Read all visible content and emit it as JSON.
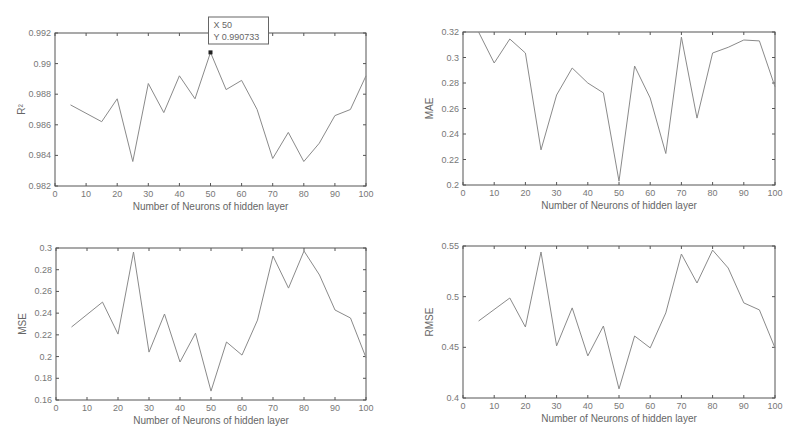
{
  "chart_data": [
    {
      "type": "line",
      "id": "r2",
      "title": "",
      "xlabel": "Number of Neurons of hidden layer",
      "ylabel": "R²",
      "xlim": [
        0,
        100
      ],
      "ylim": [
        0.982,
        0.992
      ],
      "xticks": [
        0,
        10,
        20,
        30,
        40,
        50,
        60,
        70,
        80,
        90,
        100
      ],
      "yticks": [
        0.982,
        0.984,
        0.986,
        0.988,
        0.99,
        0.992
      ],
      "ytick_labels": [
        "0.982",
        "0.984",
        "0.986",
        "0.988",
        "0.99",
        "0.992"
      ],
      "grid": false,
      "x": [
        5,
        15,
        20,
        25,
        30,
        35,
        40,
        45,
        50,
        55,
        60,
        65,
        70,
        75,
        80,
        85,
        90,
        95,
        100
      ],
      "values": [
        0.9873,
        0.9862,
        0.9877,
        0.9836,
        0.9887,
        0.9868,
        0.9892,
        0.9877,
        0.990733,
        0.9883,
        0.9889,
        0.987,
        0.9838,
        0.9855,
        0.9836,
        0.9848,
        0.9866,
        0.987,
        0.9892
      ],
      "annotation": {
        "x": 50,
        "y": 0.990733,
        "label_x": "X 50",
        "label_y": "Y 0.990733"
      }
    },
    {
      "type": "line",
      "id": "mae",
      "title": "",
      "xlabel": "Number of Neurons of hidden layer",
      "ylabel": "MAE",
      "xlim": [
        0,
        100
      ],
      "ylim": [
        0.2,
        0.32
      ],
      "xticks": [
        0,
        10,
        20,
        30,
        40,
        50,
        60,
        70,
        80,
        90,
        100
      ],
      "yticks": [
        0.2,
        0.22,
        0.24,
        0.26,
        0.28,
        0.3,
        0.32
      ],
      "ytick_labels": [
        "0.2",
        "0.22",
        "0.24",
        "0.26",
        "0.28",
        "0.3",
        "0.32"
      ],
      "grid": false,
      "x": [
        5,
        10,
        15,
        20,
        25,
        30,
        35,
        40,
        45,
        50,
        55,
        60,
        65,
        70,
        75,
        80,
        85,
        90,
        95,
        100
      ],
      "values": [
        0.32,
        0.2957,
        0.3145,
        0.3035,
        0.2275,
        0.2706,
        0.2918,
        0.28,
        0.2722,
        0.203,
        0.2933,
        0.2682,
        0.2247,
        0.316,
        0.2525,
        0.3035,
        0.308,
        0.3137,
        0.313,
        0.277
      ]
    },
    {
      "type": "line",
      "id": "mse",
      "title": "",
      "xlabel": "Number of Neurons of hidden layer",
      "ylabel": "MSE",
      "xlim": [
        0,
        100
      ],
      "ylim": [
        0.16,
        0.3
      ],
      "xticks": [
        0,
        10,
        20,
        30,
        40,
        50,
        60,
        70,
        80,
        90,
        100
      ],
      "yticks": [
        0.16,
        0.18,
        0.2,
        0.22,
        0.24,
        0.26,
        0.28,
        0.3
      ],
      "ytick_labels": [
        "0.16",
        "0.18",
        "0.2",
        "0.22",
        "0.24",
        "0.26",
        "0.28",
        "0.3"
      ],
      "grid": false,
      "x": [
        5,
        15,
        20,
        25,
        30,
        35,
        40,
        45,
        50,
        55,
        60,
        65,
        70,
        75,
        80,
        85,
        90,
        95,
        100
      ],
      "values": [
        0.2272,
        0.2502,
        0.2207,
        0.2963,
        0.2041,
        0.2392,
        0.195,
        0.2216,
        0.1682,
        0.2134,
        0.2014,
        0.2336,
        0.2926,
        0.2631,
        0.2972,
        0.2751,
        0.2429,
        0.2355,
        0.199
      ]
    },
    {
      "type": "line",
      "id": "rmse",
      "title": "",
      "xlabel": "Number of Neurons of hidden layer",
      "ylabel": "RMSE",
      "xlim": [
        0,
        100
      ],
      "ylim": [
        0.4,
        0.55
      ],
      "xticks": [
        0,
        10,
        20,
        30,
        40,
        50,
        60,
        70,
        80,
        90,
        100
      ],
      "yticks": [
        0.4,
        0.45,
        0.5,
        0.55
      ],
      "ytick_labels": [
        "0.4",
        "0.45",
        "0.5",
        "0.55"
      ],
      "grid": false,
      "x": [
        5,
        15,
        20,
        25,
        30,
        35,
        40,
        45,
        50,
        55,
        60,
        65,
        70,
        75,
        80,
        85,
        90,
        95,
        100
      ],
      "values": [
        0.476,
        0.4987,
        0.4701,
        0.5441,
        0.4514,
        0.4889,
        0.4415,
        0.4711,
        0.409,
        0.4612,
        0.4494,
        0.484,
        0.5421,
        0.5135,
        0.546,
        0.5283,
        0.4938,
        0.4869,
        0.4494
      ]
    }
  ],
  "layout": {
    "panels": [
      {
        "chart": 0,
        "left": 55,
        "top": 33,
        "width": 311,
        "height": 153
      },
      {
        "chart": 1,
        "left": 463,
        "top": 32,
        "width": 312,
        "height": 153
      },
      {
        "chart": 2,
        "left": 56,
        "top": 248,
        "width": 310,
        "height": 152
      },
      {
        "chart": 3,
        "left": 463,
        "top": 246,
        "width": 312,
        "height": 152
      }
    ]
  }
}
